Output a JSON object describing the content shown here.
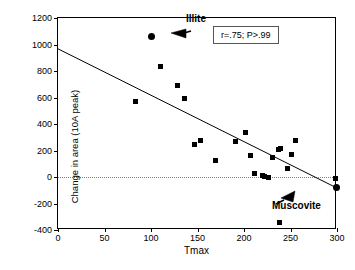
{
  "chart_data": {
    "type": "scatter",
    "title": "",
    "xlabel": "Tmax",
    "ylabel": "Change in area (10A peak)",
    "xlim": [
      0,
      300
    ],
    "ylim": [
      -400,
      1200
    ],
    "xticks": [
      0,
      50,
      100,
      150,
      200,
      250,
      300
    ],
    "yticks": [
      -400,
      -200,
      0,
      200,
      400,
      600,
      800,
      1000,
      1200
    ],
    "grid": false,
    "zero_reference_line": 0,
    "legend": "none",
    "series": [
      {
        "name": "samples",
        "marker": "square",
        "color": "#000000",
        "points": [
          {
            "x": 83,
            "y": 570
          },
          {
            "x": 110,
            "y": 835
          },
          {
            "x": 129,
            "y": 688
          },
          {
            "x": 136,
            "y": 595
          },
          {
            "x": 147,
            "y": 245
          },
          {
            "x": 153,
            "y": 272
          },
          {
            "x": 169,
            "y": 128
          },
          {
            "x": 191,
            "y": 268
          },
          {
            "x": 202,
            "y": 335
          },
          {
            "x": 207,
            "y": 160
          },
          {
            "x": 211,
            "y": 25
          },
          {
            "x": 220,
            "y": 10
          },
          {
            "x": 222,
            "y": 3
          },
          {
            "x": 226,
            "y": 0
          },
          {
            "x": 231,
            "y": 145
          },
          {
            "x": 237,
            "y": 205
          },
          {
            "x": 239,
            "y": 218
          },
          {
            "x": 238,
            "y": -340
          },
          {
            "x": 247,
            "y": 65
          },
          {
            "x": 251,
            "y": 172
          },
          {
            "x": 255,
            "y": 272
          },
          {
            "x": 298,
            "y": -8
          }
        ]
      },
      {
        "name": "endmembers",
        "marker": "circle",
        "color": "#000000",
        "points": [
          {
            "x": 100,
            "y": 1060,
            "label": "Illite"
          },
          {
            "x": 299,
            "y": -78,
            "label": "Muscovite"
          }
        ]
      }
    ],
    "fit_line": {
      "name": "regression",
      "x0": 0,
      "y0": 965,
      "x1": 300,
      "y1": -88,
      "color": "#000000"
    },
    "annotations": [
      {
        "name": "illite",
        "text": "Illite"
      },
      {
        "name": "muscovite",
        "text": "Muscovite"
      },
      {
        "name": "stats",
        "text": "r=.75; P>.99"
      }
    ]
  },
  "axis": {
    "x_title": "Tmax",
    "y_title": "Change in area (10A peak)",
    "x_tick_labels": [
      "0",
      "50",
      "100",
      "150",
      "200",
      "250",
      "300"
    ],
    "y_tick_labels": [
      "-400",
      "-200",
      "0",
      "200",
      "400",
      "600",
      "800",
      "1000",
      "1200"
    ]
  },
  "labels": {
    "illite": "Illite",
    "muscovite": "Muscovite",
    "stats": "r=.75; P>.99"
  },
  "colors": {
    "marker": "#000000",
    "frame": "#000000",
    "zero_line": "#808080"
  }
}
